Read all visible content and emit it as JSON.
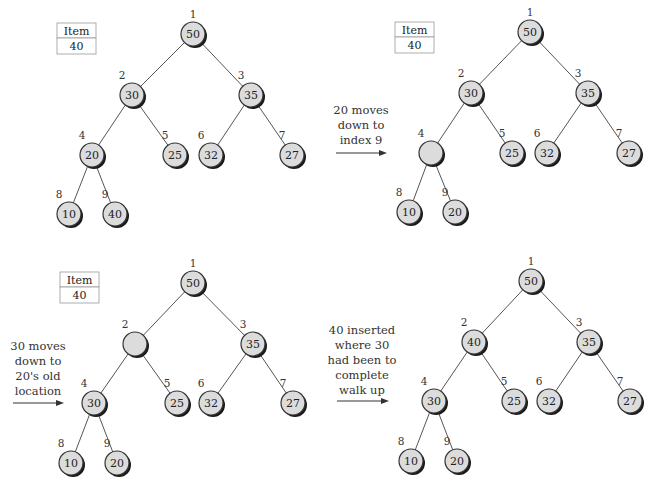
{
  "colors": {
    "node_fill": "#dcdcdc",
    "node_stroke": "#333333",
    "shadow": "#1a1a1a",
    "edge": "#555555",
    "text": "#222222"
  },
  "edges": [
    [
      1,
      2
    ],
    [
      1,
      3
    ],
    [
      2,
      4
    ],
    [
      2,
      5
    ],
    [
      3,
      6
    ],
    [
      3,
      7
    ],
    [
      4,
      8
    ],
    [
      4,
      9
    ]
  ],
  "panels": [
    {
      "id": "step-1",
      "offset": [
        0,
        0
      ],
      "item_box": {
        "header": "Item",
        "value": "40",
        "x": 57,
        "y": 23
      },
      "caption": null,
      "nodes": [
        {
          "index": "1",
          "value": "50",
          "x": 193,
          "y": 34
        },
        {
          "index": "2",
          "value": "30",
          "x": 132,
          "y": 95
        },
        {
          "index": "3",
          "value": "35",
          "x": 251,
          "y": 95
        },
        {
          "index": "4",
          "value": "20",
          "x": 92,
          "y": 155
        },
        {
          "index": "5",
          "value": "25",
          "x": 175,
          "y": 155
        },
        {
          "index": "6",
          "value": "32",
          "x": 211,
          "y": 155
        },
        {
          "index": "7",
          "value": "27",
          "x": 292,
          "y": 155
        },
        {
          "index": "8",
          "value": "10",
          "x": 69,
          "y": 214
        },
        {
          "index": "9",
          "value": "40",
          "x": 115,
          "y": 214
        }
      ]
    },
    {
      "id": "step-2",
      "offset": [
        0,
        0
      ],
      "item_box": {
        "header": "Item",
        "value": "40",
        "x": 395,
        "y": 22
      },
      "caption": {
        "lines": [
          "20 moves",
          "down to",
          "index 9"
        ],
        "x": 361,
        "y": 114,
        "arrow": {
          "x1": 336,
          "x2": 387,
          "y": 153
        }
      },
      "nodes": [
        {
          "index": "1",
          "value": "50",
          "x": 530,
          "y": 32
        },
        {
          "index": "2",
          "value": "30",
          "x": 471,
          "y": 93
        },
        {
          "index": "3",
          "value": "35",
          "x": 588,
          "y": 93
        },
        {
          "index": "4",
          "value": "",
          "x": 431,
          "y": 153
        },
        {
          "index": "5",
          "value": "25",
          "x": 512,
          "y": 153
        },
        {
          "index": "6",
          "value": "32",
          "x": 547,
          "y": 153
        },
        {
          "index": "7",
          "value": "27",
          "x": 629,
          "y": 153
        },
        {
          "index": "8",
          "value": "10",
          "x": 409,
          "y": 212
        },
        {
          "index": "9",
          "value": "20",
          "x": 455,
          "y": 212
        }
      ]
    },
    {
      "id": "step-3",
      "offset": [
        0,
        0
      ],
      "item_box": {
        "header": "Item",
        "value": "40",
        "x": 60,
        "y": 272
      },
      "caption": {
        "lines": [
          "30 moves",
          "down to",
          "20's old",
          "location"
        ],
        "x": 38,
        "y": 350,
        "arrow": {
          "x1": 13,
          "x2": 64,
          "y": 403
        }
      },
      "nodes": [
        {
          "index": "1",
          "value": "50",
          "x": 193,
          "y": 283
        },
        {
          "index": "2",
          "value": "",
          "x": 135,
          "y": 344
        },
        {
          "index": "3",
          "value": "35",
          "x": 253,
          "y": 344
        },
        {
          "index": "4",
          "value": "30",
          "x": 94,
          "y": 403
        },
        {
          "index": "5",
          "value": "25",
          "x": 177,
          "y": 403
        },
        {
          "index": "6",
          "value": "32",
          "x": 211,
          "y": 403
        },
        {
          "index": "7",
          "value": "27",
          "x": 293,
          "y": 403
        },
        {
          "index": "8",
          "value": "10",
          "x": 71,
          "y": 463
        },
        {
          "index": "9",
          "value": "20",
          "x": 117,
          "y": 463
        }
      ]
    },
    {
      "id": "step-4",
      "offset": [
        0,
        0
      ],
      "item_box": null,
      "caption": {
        "lines": [
          "40 inserted",
          "where 30",
          "had been to",
          "complete",
          "walk up"
        ],
        "x": 362,
        "y": 334,
        "arrow": {
          "x1": 337,
          "x2": 389,
          "y": 401
        }
      },
      "nodes": [
        {
          "index": "1",
          "value": "50",
          "x": 531,
          "y": 281
        },
        {
          "index": "2",
          "value": "40",
          "x": 474,
          "y": 342
        },
        {
          "index": "3",
          "value": "35",
          "x": 589,
          "y": 342
        },
        {
          "index": "4",
          "value": "30",
          "x": 434,
          "y": 401
        },
        {
          "index": "5",
          "value": "25",
          "x": 514,
          "y": 401
        },
        {
          "index": "6",
          "value": "32",
          "x": 549,
          "y": 401
        },
        {
          "index": "7",
          "value": "27",
          "x": 630,
          "y": 401
        },
        {
          "index": "8",
          "value": "10",
          "x": 411,
          "y": 461
        },
        {
          "index": "9",
          "value": "20",
          "x": 457,
          "y": 461
        }
      ]
    }
  ]
}
